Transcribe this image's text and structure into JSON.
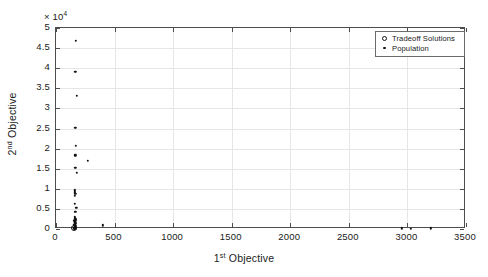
{
  "chart_data": {
    "type": "scatter",
    "title": "",
    "xlabel": "1st Objective",
    "xlabel_base": "1",
    "xlabel_sup": "st",
    "xlabel_rest": " Objective",
    "ylabel": "2nd Objective",
    "ylabel_base": "2",
    "ylabel_sup": "nd",
    "ylabel_rest": " Objective",
    "y_exponent_text": "× 10",
    "y_exponent_value": "4",
    "xlim": [
      0,
      3500
    ],
    "ylim": [
      0,
      50000
    ],
    "y_scale_factor": 10000,
    "grid": true,
    "xticks": [
      0,
      500,
      1000,
      1500,
      2000,
      2500,
      3000,
      3500
    ],
    "xticklabels": [
      "0",
      "500",
      "1000",
      "1500",
      "2000",
      "2500",
      "3000",
      "3500"
    ],
    "yticks": [
      0,
      5000,
      10000,
      15000,
      20000,
      25000,
      30000,
      35000,
      40000,
      45000,
      50000
    ],
    "yticklabels": [
      "0",
      "0.5",
      "1",
      "1.5",
      "2",
      "2.5",
      "3",
      "3.5",
      "4",
      "4.5",
      "5"
    ],
    "legend": {
      "position": "top-right",
      "entries": [
        {
          "label": "Tradeoff Solutions",
          "marker": "circle-open"
        },
        {
          "label": "Population",
          "marker": "dot"
        }
      ]
    },
    "series": [
      {
        "name": "Population",
        "marker": "dot",
        "color": "#111111",
        "points": [
          [
            168,
            46800
          ],
          [
            165,
            39100
          ],
          [
            178,
            33100
          ],
          [
            165,
            25200
          ],
          [
            168,
            20700
          ],
          [
            166,
            18300
          ],
          [
            272,
            17000
          ],
          [
            165,
            15200
          ],
          [
            178,
            14000
          ],
          [
            162,
            9600
          ],
          [
            163,
            9150
          ],
          [
            164,
            8700
          ],
          [
            161,
            8200
          ],
          [
            160,
            6200
          ],
          [
            172,
            5300
          ],
          [
            166,
            4300
          ],
          [
            158,
            3000
          ],
          [
            162,
            2800
          ],
          [
            168,
            2600
          ],
          [
            160,
            2400
          ],
          [
            165,
            2250
          ],
          [
            170,
            2100
          ],
          [
            156,
            2000
          ],
          [
            163,
            1850
          ],
          [
            158,
            1700
          ],
          [
            166,
            1550
          ],
          [
            161,
            1400
          ],
          [
            168,
            1250
          ],
          [
            155,
            1100
          ],
          [
            160,
            950
          ],
          [
            164,
            800
          ],
          [
            159,
            650
          ],
          [
            167,
            520
          ],
          [
            162,
            400
          ],
          [
            157,
            280
          ],
          [
            163,
            180
          ],
          [
            158,
            100
          ],
          [
            170,
            60
          ],
          [
            152,
            30
          ],
          [
            160,
            10
          ],
          [
            400,
            900
          ],
          [
            2950,
            180
          ],
          [
            3030,
            120
          ],
          [
            3200,
            150
          ]
        ]
      },
      {
        "name": "Tradeoff Solutions",
        "marker": "circle-open",
        "color": "#111111",
        "points": [
          [
            152,
            150
          ]
        ]
      }
    ]
  }
}
